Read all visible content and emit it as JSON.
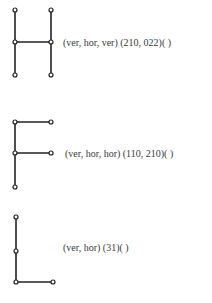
{
  "figures": [
    {
      "letter": "H",
      "label": "(ver, hor, ver) (210, 022)( )",
      "label_pos": [
        63,
        37
      ],
      "nodes": [
        [
          15,
          10
        ],
        [
          51,
          10
        ],
        [
          15,
          42
        ],
        [
          51,
          42
        ],
        [
          15,
          75
        ],
        [
          51,
          75
        ]
      ],
      "edges": [
        [
          0,
          2
        ],
        [
          2,
          4
        ],
        [
          1,
          3
        ],
        [
          3,
          5
        ],
        [
          2,
          3
        ]
      ]
    },
    {
      "letter": "F",
      "label": "(ver, hor, hor) (110, 210)( )",
      "label_pos": [
        65,
        148
      ],
      "nodes": [
        [
          15,
          122
        ],
        [
          51,
          122
        ],
        [
          15,
          153
        ],
        [
          51,
          153
        ],
        [
          15,
          187
        ]
      ],
      "edges": [
        [
          0,
          2
        ],
        [
          2,
          4
        ],
        [
          0,
          1
        ],
        [
          2,
          3
        ]
      ]
    },
    {
      "letter": "L",
      "label": "(ver, hor) (31)( )",
      "label_pos": [
        63,
        242
      ],
      "nodes": [
        [
          16,
          217
        ],
        [
          16,
          251
        ],
        [
          16,
          282
        ],
        [
          53,
          282
        ]
      ],
      "edges": [
        [
          0,
          1
        ],
        [
          1,
          2
        ],
        [
          2,
          3
        ]
      ]
    }
  ],
  "style": {
    "stroke": "#222222",
    "node_fill": "#ffffff",
    "node_radius": 2
  }
}
